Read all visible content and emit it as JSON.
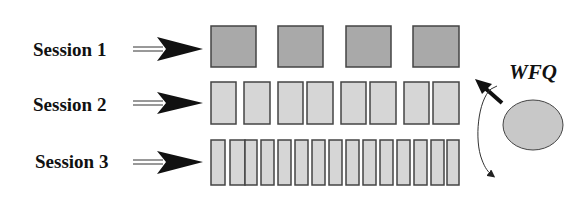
{
  "diagram": {
    "scheduler_label": "WFQ",
    "colors": {
      "session1_fill": "#a9a9a9",
      "session23_fill": "#d6d6d6",
      "stroke": "#444444",
      "server_fill": "#c8c8c8",
      "arrow": "#111111"
    },
    "sessions": [
      {
        "label": "Session 1",
        "y": 26,
        "h": 41,
        "fill": "#a9a9a9",
        "packets": [
          [
            211,
            45
          ],
          [
            278,
            45
          ],
          [
            346,
            45
          ],
          [
            413,
            46
          ]
        ]
      },
      {
        "label": "Session 2",
        "y": 82,
        "h": 42,
        "fill": "#d6d6d6",
        "packets": [
          [
            211,
            25
          ],
          [
            244,
            26
          ],
          [
            278,
            25
          ],
          [
            307,
            26
          ],
          [
            341,
            25
          ],
          [
            370,
            26
          ],
          [
            404,
            25
          ],
          [
            433,
            26
          ]
        ]
      },
      {
        "label": "Session 3",
        "y": 140,
        "h": 45,
        "fill": "#d6d6d6",
        "packets": [
          [
            211,
            14
          ],
          [
            230,
            15
          ],
          [
            245,
            12
          ],
          [
            261,
            13
          ],
          [
            278,
            13
          ],
          [
            295,
            13
          ],
          [
            312,
            13
          ],
          [
            329,
            13
          ],
          [
            346,
            13
          ],
          [
            363,
            13
          ],
          [
            380,
            13
          ],
          [
            397,
            13
          ],
          [
            414,
            13
          ],
          [
            431,
            13
          ],
          [
            447,
            12
          ]
        ]
      }
    ]
  }
}
